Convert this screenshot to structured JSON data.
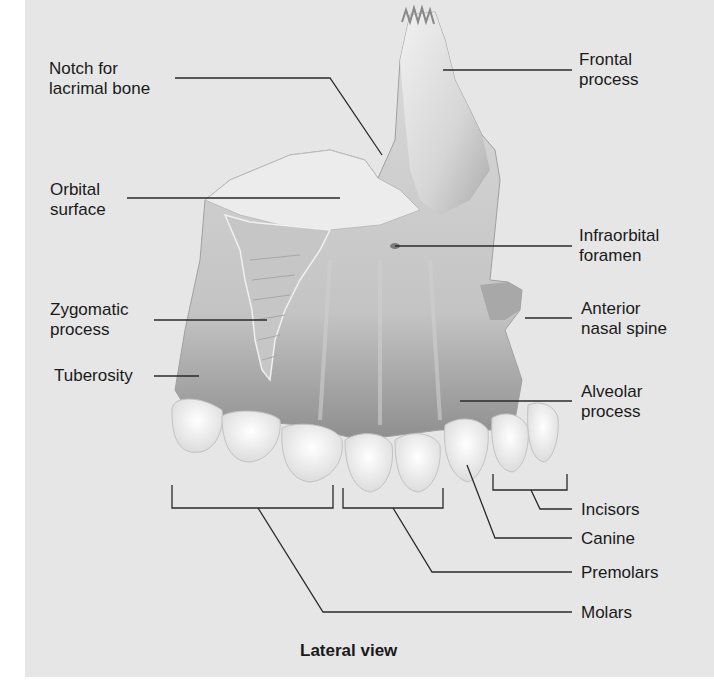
{
  "figure": {
    "caption": "Lateral view",
    "colors": {
      "background": "#e6e6e6",
      "bone_light": "#f2f2f2",
      "bone_shadow": "#9a9a9a",
      "teeth": "#f8f8f8",
      "leader_line": "#2a2a2a",
      "text": "#1a1a1a"
    }
  },
  "labels": {
    "notch_lacrimal": "Notch for\nlacrimal bone",
    "orbital_surface": "Orbital\nsurface",
    "zygomatic_process": "Zygomatic\nprocess",
    "tuberosity": "Tuberosity",
    "frontal_process": "Frontal\nprocess",
    "infraorbital_foramen": "Infraorbital\nforamen",
    "anterior_nasal_spine": "Anterior\nnasal spine",
    "alveolar_process": "Alveolar\nprocess",
    "incisors": "Incisors",
    "canine": "Canine",
    "premolars": "Premolars",
    "molars": "Molars"
  }
}
